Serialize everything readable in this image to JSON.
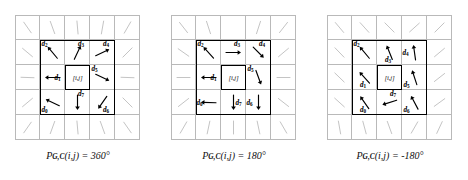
{
  "figure": {
    "type": "diagram",
    "grid": {
      "rows": 5,
      "cols": 5,
      "gridline_color": "#b9b9b9",
      "box_color": "#000000"
    },
    "center_label": "[i,j]"
  },
  "panels": [
    {
      "id": "panel-360",
      "caption": {
        "symbol": "P",
        "subscript": "G,C",
        "argument": "(i,j)",
        "equals": "=",
        "value": "360°"
      },
      "center_label": "[i,j]",
      "vectors": [
        {
          "name": "d0",
          "label": "d",
          "sub": "0",
          "cell": "bottom-left",
          "angle": -65,
          "label_pos": "bottom-left"
        },
        {
          "name": "d1",
          "label": "d",
          "sub": "1",
          "cell": "middle-left",
          "angle": -90,
          "label_pos": "right"
        },
        {
          "name": "d2",
          "label": "d",
          "sub": "2",
          "cell": "top-left",
          "angle": -40,
          "label_pos": "top-left"
        },
        {
          "name": "d3",
          "label": "d",
          "sub": "3",
          "cell": "top-center",
          "angle": 25,
          "label_pos": "top-right"
        },
        {
          "name": "d4",
          "label": "d",
          "sub": "4",
          "cell": "top-right",
          "angle": 65,
          "label_pos": "top-right"
        },
        {
          "name": "d5",
          "label": "d",
          "sub": "5",
          "cell": "middle-right",
          "angle": 115,
          "label_pos": "top-left"
        },
        {
          "name": "d6",
          "label": "d",
          "sub": "6",
          "cell": "bottom-right",
          "angle": -145,
          "label_pos": "bottom-right"
        },
        {
          "name": "d7",
          "label": "d",
          "sub": "7",
          "cell": "bottom-center",
          "angle": 180,
          "label_pos": "top-right"
        }
      ]
    },
    {
      "id": "panel-180",
      "caption": {
        "symbol": "P",
        "subscript": "G,C",
        "argument": "(i,j)",
        "equals": "=",
        "value": "180°"
      },
      "center_label": "[i,j]",
      "vectors": [
        {
          "name": "d0",
          "label": "d",
          "sub": "0",
          "cell": "bottom-left",
          "angle": -88,
          "label_pos": "left"
        },
        {
          "name": "d1",
          "label": "d",
          "sub": "1",
          "cell": "middle-left",
          "angle": -90,
          "label_pos": "right"
        },
        {
          "name": "d2",
          "label": "d",
          "sub": "2",
          "cell": "top-left",
          "angle": -42,
          "label_pos": "top-left"
        },
        {
          "name": "d3",
          "label": "d",
          "sub": "3",
          "cell": "top-center",
          "angle": 90,
          "label_pos": "top-right"
        },
        {
          "name": "d4",
          "label": "d",
          "sub": "4",
          "cell": "top-right",
          "angle": 135,
          "label_pos": "top-right"
        },
        {
          "name": "d5",
          "label": "d",
          "sub": "5",
          "cell": "middle-right",
          "angle": 160,
          "label_pos": "top-left"
        },
        {
          "name": "d6",
          "label": "d",
          "sub": "6",
          "cell": "bottom-right",
          "angle": 180,
          "label_pos": "left"
        },
        {
          "name": "d7",
          "label": "d",
          "sub": "7",
          "cell": "bottom-center",
          "angle": 180,
          "label_pos": "right"
        }
      ]
    },
    {
      "id": "panel-minus180",
      "caption": {
        "symbol": "P",
        "subscript": "G,C",
        "argument": "(i,j)",
        "equals": "=",
        "value": "-180°"
      },
      "center_label": "[i,j]",
      "vectors": [
        {
          "name": "d0",
          "label": "d",
          "sub": "0",
          "cell": "bottom-left",
          "angle": -35,
          "label_pos": "bottom"
        },
        {
          "name": "d1",
          "label": "d",
          "sub": "1",
          "cell": "middle-left",
          "angle": -42,
          "label_pos": "bottom"
        },
        {
          "name": "d2",
          "label": "d",
          "sub": "2",
          "cell": "top-left",
          "angle": -40,
          "label_pos": "top-left"
        },
        {
          "name": "d3",
          "label": "d",
          "sub": "3",
          "cell": "top-center",
          "angle": -22,
          "label_pos": "bottom"
        },
        {
          "name": "d4",
          "label": "d",
          "sub": "4",
          "cell": "top-right",
          "angle": -8,
          "label_pos": "left"
        },
        {
          "name": "d5",
          "label": "d",
          "sub": "5",
          "cell": "middle-right",
          "angle": -18,
          "label_pos": "bottom-left"
        },
        {
          "name": "d6",
          "label": "d",
          "sub": "6",
          "cell": "bottom-right",
          "angle": -28,
          "label_pos": "bottom-left"
        },
        {
          "name": "d7",
          "label": "d",
          "sub": "7",
          "cell": "bottom-center",
          "angle": -108,
          "label_pos": "top-right"
        }
      ]
    }
  ],
  "outer_ring_strokes": {
    "description": "faint gray line segments without arrowheads in the outer ring cells",
    "color": "#c4c4c4",
    "panel_angles": [
      [
        -35,
        -20,
        -5,
        10,
        30,
        -50,
        0,
        0,
        0,
        45,
        -88,
        0,
        0,
        0,
        92,
        -130,
        0,
        0,
        0,
        135,
        -145,
        -160,
        175,
        160,
        145
      ],
      [
        -38,
        -18,
        0,
        18,
        38,
        -55,
        0,
        0,
        0,
        50,
        -90,
        0,
        0,
        0,
        90,
        -128,
        0,
        0,
        0,
        128,
        -150,
        -168,
        180,
        168,
        150
      ],
      [
        -40,
        -42,
        -45,
        -132,
        -135,
        -44,
        0,
        0,
        0,
        -130,
        -46,
        0,
        0,
        0,
        -128,
        -48,
        0,
        0,
        0,
        -126,
        -10,
        -15,
        -20,
        -150,
        -155
      ]
    ]
  }
}
